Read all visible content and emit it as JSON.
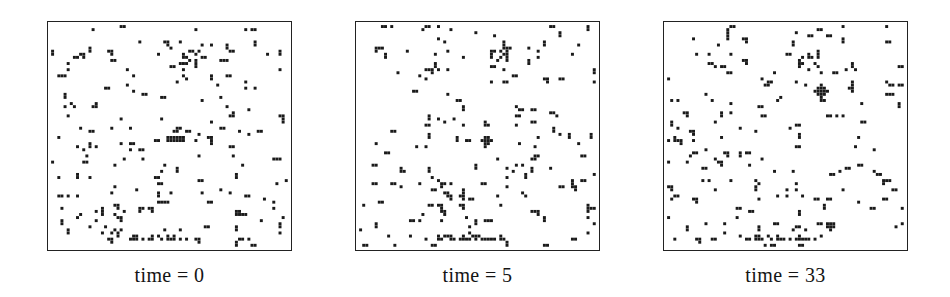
{
  "figure": {
    "background_color": "#ffffff",
    "cell_color": "#1a1a1a",
    "border_color": "#222222",
    "panel_count": 3
  },
  "chart_data": {
    "type": "heatmap",
    "title": "",
    "subtitle": "",
    "xlabel": "",
    "ylabel": "",
    "grid": false,
    "legend_position": "none",
    "axis_ranges": {
      "x": [
        0,
        78
      ],
      "y": [
        0,
        74
      ]
    },
    "cell_pixel_size": 2.4,
    "panels": [
      {
        "label": "time = 0",
        "time": 0,
        "grid_cols": 78,
        "grid_rows": 74,
        "occupied_count": 318,
        "seed": 10411,
        "density": 0.055,
        "features": [
          {
            "name": "horizontal-bar",
            "col": 38,
            "row": 37,
            "w": 6,
            "h": 2
          },
          {
            "name": "dense-bottom-band",
            "col_start": 26,
            "col_end": 48,
            "row": 70
          },
          {
            "name": "upper-right-cluster",
            "col": 46,
            "row": 12
          }
        ]
      },
      {
        "label": "time = 5",
        "time": 5,
        "grid_cols": 78,
        "grid_rows": 74,
        "occupied_count": 312,
        "seed": 20717,
        "density": 0.054,
        "features": [
          {
            "name": "cross-cluster",
            "col": 40,
            "row": 37,
            "w": 4,
            "h": 4
          },
          {
            "name": "dense-bottom-band",
            "col_start": 26,
            "col_end": 48,
            "row": 70
          },
          {
            "name": "upper-right-cluster",
            "col": 46,
            "row": 12
          }
        ]
      },
      {
        "label": "time = 33",
        "time": 33,
        "grid_cols": 78,
        "grid_rows": 74,
        "occupied_count": 309,
        "seed": 33919,
        "density": 0.053,
        "features": [
          {
            "name": "plus-cluster",
            "col": 48,
            "row": 20,
            "w": 5,
            "h": 5
          },
          {
            "name": "dense-bottom-band",
            "col_start": 26,
            "col_end": 48,
            "row": 70
          },
          {
            "name": "upper-right-cluster",
            "col": 46,
            "row": 12
          }
        ]
      }
    ],
    "categories": [
      "time = 0",
      "time = 5",
      "time = 33"
    ],
    "values": [
      318,
      312,
      309
    ]
  },
  "panels": [
    {
      "id": "panel-time-0",
      "caption": "time = 0",
      "left": 47
    },
    {
      "id": "panel-time-5",
      "caption": "time = 5",
      "left": 355
    },
    {
      "id": "panel-time-33",
      "caption": "time = 33",
      "left": 663
    }
  ]
}
